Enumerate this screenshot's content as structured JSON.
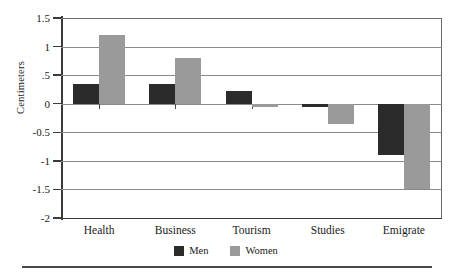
{
  "chart_data": {
    "type": "bar",
    "title": "",
    "xlabel": "",
    "ylabel": "Centimeters",
    "categories": [
      "Health",
      "Business",
      "Tourism",
      "Studies",
      "Emigrate"
    ],
    "series": [
      {
        "name": "Men",
        "color": "#2b2b2b",
        "values": [
          0.35,
          0.35,
          0.22,
          -0.05,
          -0.9
        ]
      },
      {
        "name": "Women",
        "color": "#9a9a9a",
        "values": [
          1.2,
          0.8,
          -0.05,
          -0.35,
          -1.5
        ]
      }
    ],
    "ylim": [
      -2,
      1.5
    ],
    "yticks": [
      1.5,
      1,
      0.5,
      0,
      -0.5,
      -1,
      -1.5,
      -2
    ],
    "ytick_labels": [
      "1.5",
      "1",
      ".5",
      "0",
      "-0.5",
      "-1",
      "-1.5",
      "-2"
    ],
    "grid": true,
    "legend_position": "bottom-center"
  },
  "legend": {
    "items": [
      {
        "label": "Men"
      },
      {
        "label": "Women"
      }
    ]
  },
  "colors": {
    "men": "#2b2b2b",
    "women": "#9a9a9a",
    "grid": "#8a8a8a",
    "axis": "#3b3b3b"
  }
}
